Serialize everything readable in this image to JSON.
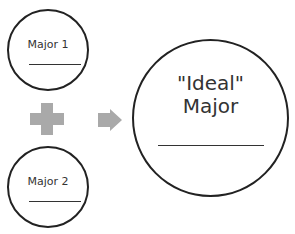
{
  "diagram": {
    "major1": {
      "label": "Major 1"
    },
    "major2": {
      "label": "Major 2"
    },
    "ideal": {
      "line1": "\"Ideal\"",
      "line2": "Major"
    },
    "operator": {
      "icon": "plus-icon",
      "color": "#a9a9a9"
    },
    "result_arrow": {
      "icon": "arrow-right-icon",
      "color": "#a9a9a9"
    },
    "stroke_color": "#222222"
  }
}
